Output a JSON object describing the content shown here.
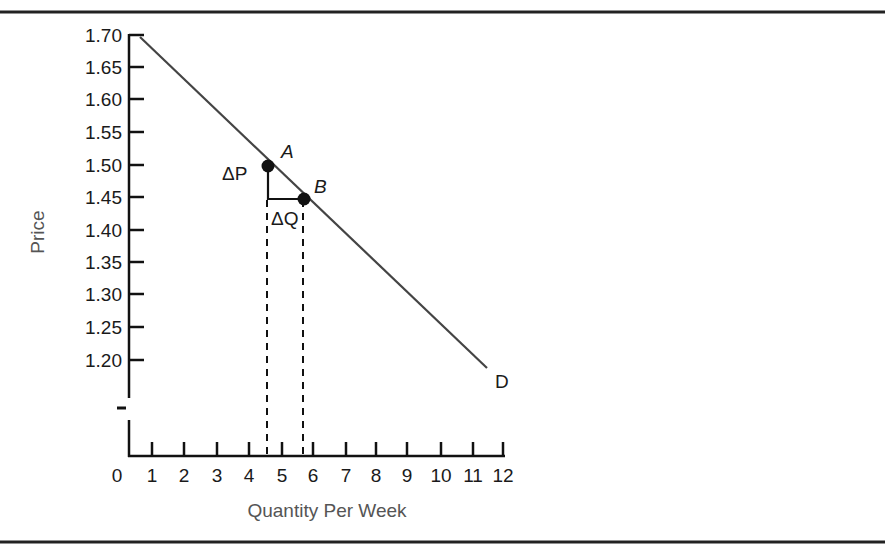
{
  "chart_data": {
    "type": "line",
    "title": "",
    "xlabel": "Quantity Per Week",
    "ylabel": "Price",
    "x_ticks": [
      "0",
      "1",
      "2",
      "3",
      "4",
      "5",
      "6",
      "7",
      "8",
      "9",
      "10",
      "11",
      "12"
    ],
    "y_ticks": [
      "1.70",
      "1.65",
      "1.60",
      "1.55",
      "1.50",
      "1.45",
      "1.40",
      "1.35",
      "1.30",
      "1.25",
      "1.20"
    ],
    "xlim": [
      0,
      12
    ],
    "ylim": [
      1.2,
      1.7
    ],
    "y_axis_break": true,
    "grid": false,
    "series": [
      {
        "name": "D",
        "x": [
          0.3,
          10.5
        ],
        "y": [
          1.69,
          1.19
        ]
      }
    ],
    "points": [
      {
        "label": "A",
        "x": 4,
        "y": 1.5
      },
      {
        "label": "B",
        "x": 5,
        "y": 1.45
      }
    ],
    "annotations": [
      {
        "text": "ΔP",
        "description": "change in price between A and B"
      },
      {
        "text": "ΔQ",
        "description": "change in quantity between A and B"
      },
      {
        "text": "D",
        "description": "demand curve label"
      }
    ]
  }
}
